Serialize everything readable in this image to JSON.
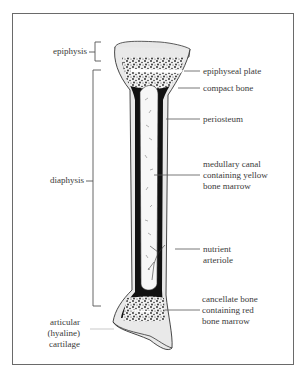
{
  "diagram": {
    "colors": {
      "frame": "#6a6a6a",
      "ink": "#1a1a1a",
      "text": "#3a3a3a",
      "cartilage": "#e6e6e6",
      "marrow_yellow": "#f7f7f7",
      "compact_bone": "#111111"
    },
    "left_labels": {
      "epiphysis": "epiphysis",
      "diaphysis": "diaphysis",
      "cartilage_line1": "articular",
      "cartilage_line2": "(hyaline)",
      "cartilage_line3": "cartilage"
    },
    "right_labels": {
      "epiphyseal_plate": "epiphyseal plate",
      "compact_bone": "compact bone",
      "periosteum": "periosteum",
      "medullary_line1": "medullary canal",
      "medullary_line2": "containing yellow",
      "medullary_line3": "bone marrow",
      "nutrient_line1": "nutrient",
      "nutrient_line2": "arteriole",
      "cancellate_line1": "cancellate bone",
      "cancellate_line2": "containing red",
      "cancellate_line3": "bone marrow"
    }
  }
}
